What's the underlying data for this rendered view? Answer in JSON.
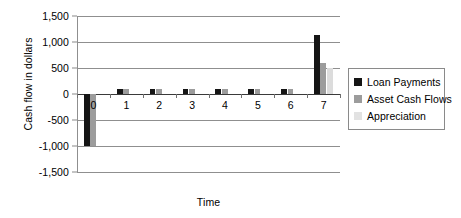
{
  "chart_data": {
    "type": "bar",
    "title": "",
    "xlabel": "Time",
    "ylabel": "Cash flow in dollars",
    "categories": [
      "0",
      "1",
      "2",
      "3",
      "4",
      "5",
      "6",
      "7"
    ],
    "series": [
      {
        "name": "Loan Payments",
        "color": "#151515",
        "values": [
          -1000,
          100,
          100,
          100,
          100,
          100,
          100,
          1130
        ]
      },
      {
        "name": "Asset Cash Flows",
        "color": "#9c9c9c",
        "values": [
          -1000,
          100,
          100,
          100,
          100,
          100,
          100,
          600
        ]
      },
      {
        "name": "Appreciation",
        "color": "#e2e2e2",
        "values": [
          0,
          0,
          0,
          0,
          0,
          0,
          0,
          500
        ]
      }
    ],
    "ylim": [
      -1500,
      1500
    ],
    "y_ticks": [
      1500,
      1000,
      500,
      0,
      -500,
      -1000,
      -1500
    ],
    "y_tick_labels": [
      "1,500",
      "1,000",
      "500",
      "0",
      "-500",
      "-1,000",
      "-1,500"
    ],
    "grid": true,
    "legend_position": "right"
  },
  "legend": {
    "items": [
      {
        "label": "Loan Payments"
      },
      {
        "label": "Asset Cash Flows"
      },
      {
        "label": "Appreciation"
      }
    ]
  }
}
